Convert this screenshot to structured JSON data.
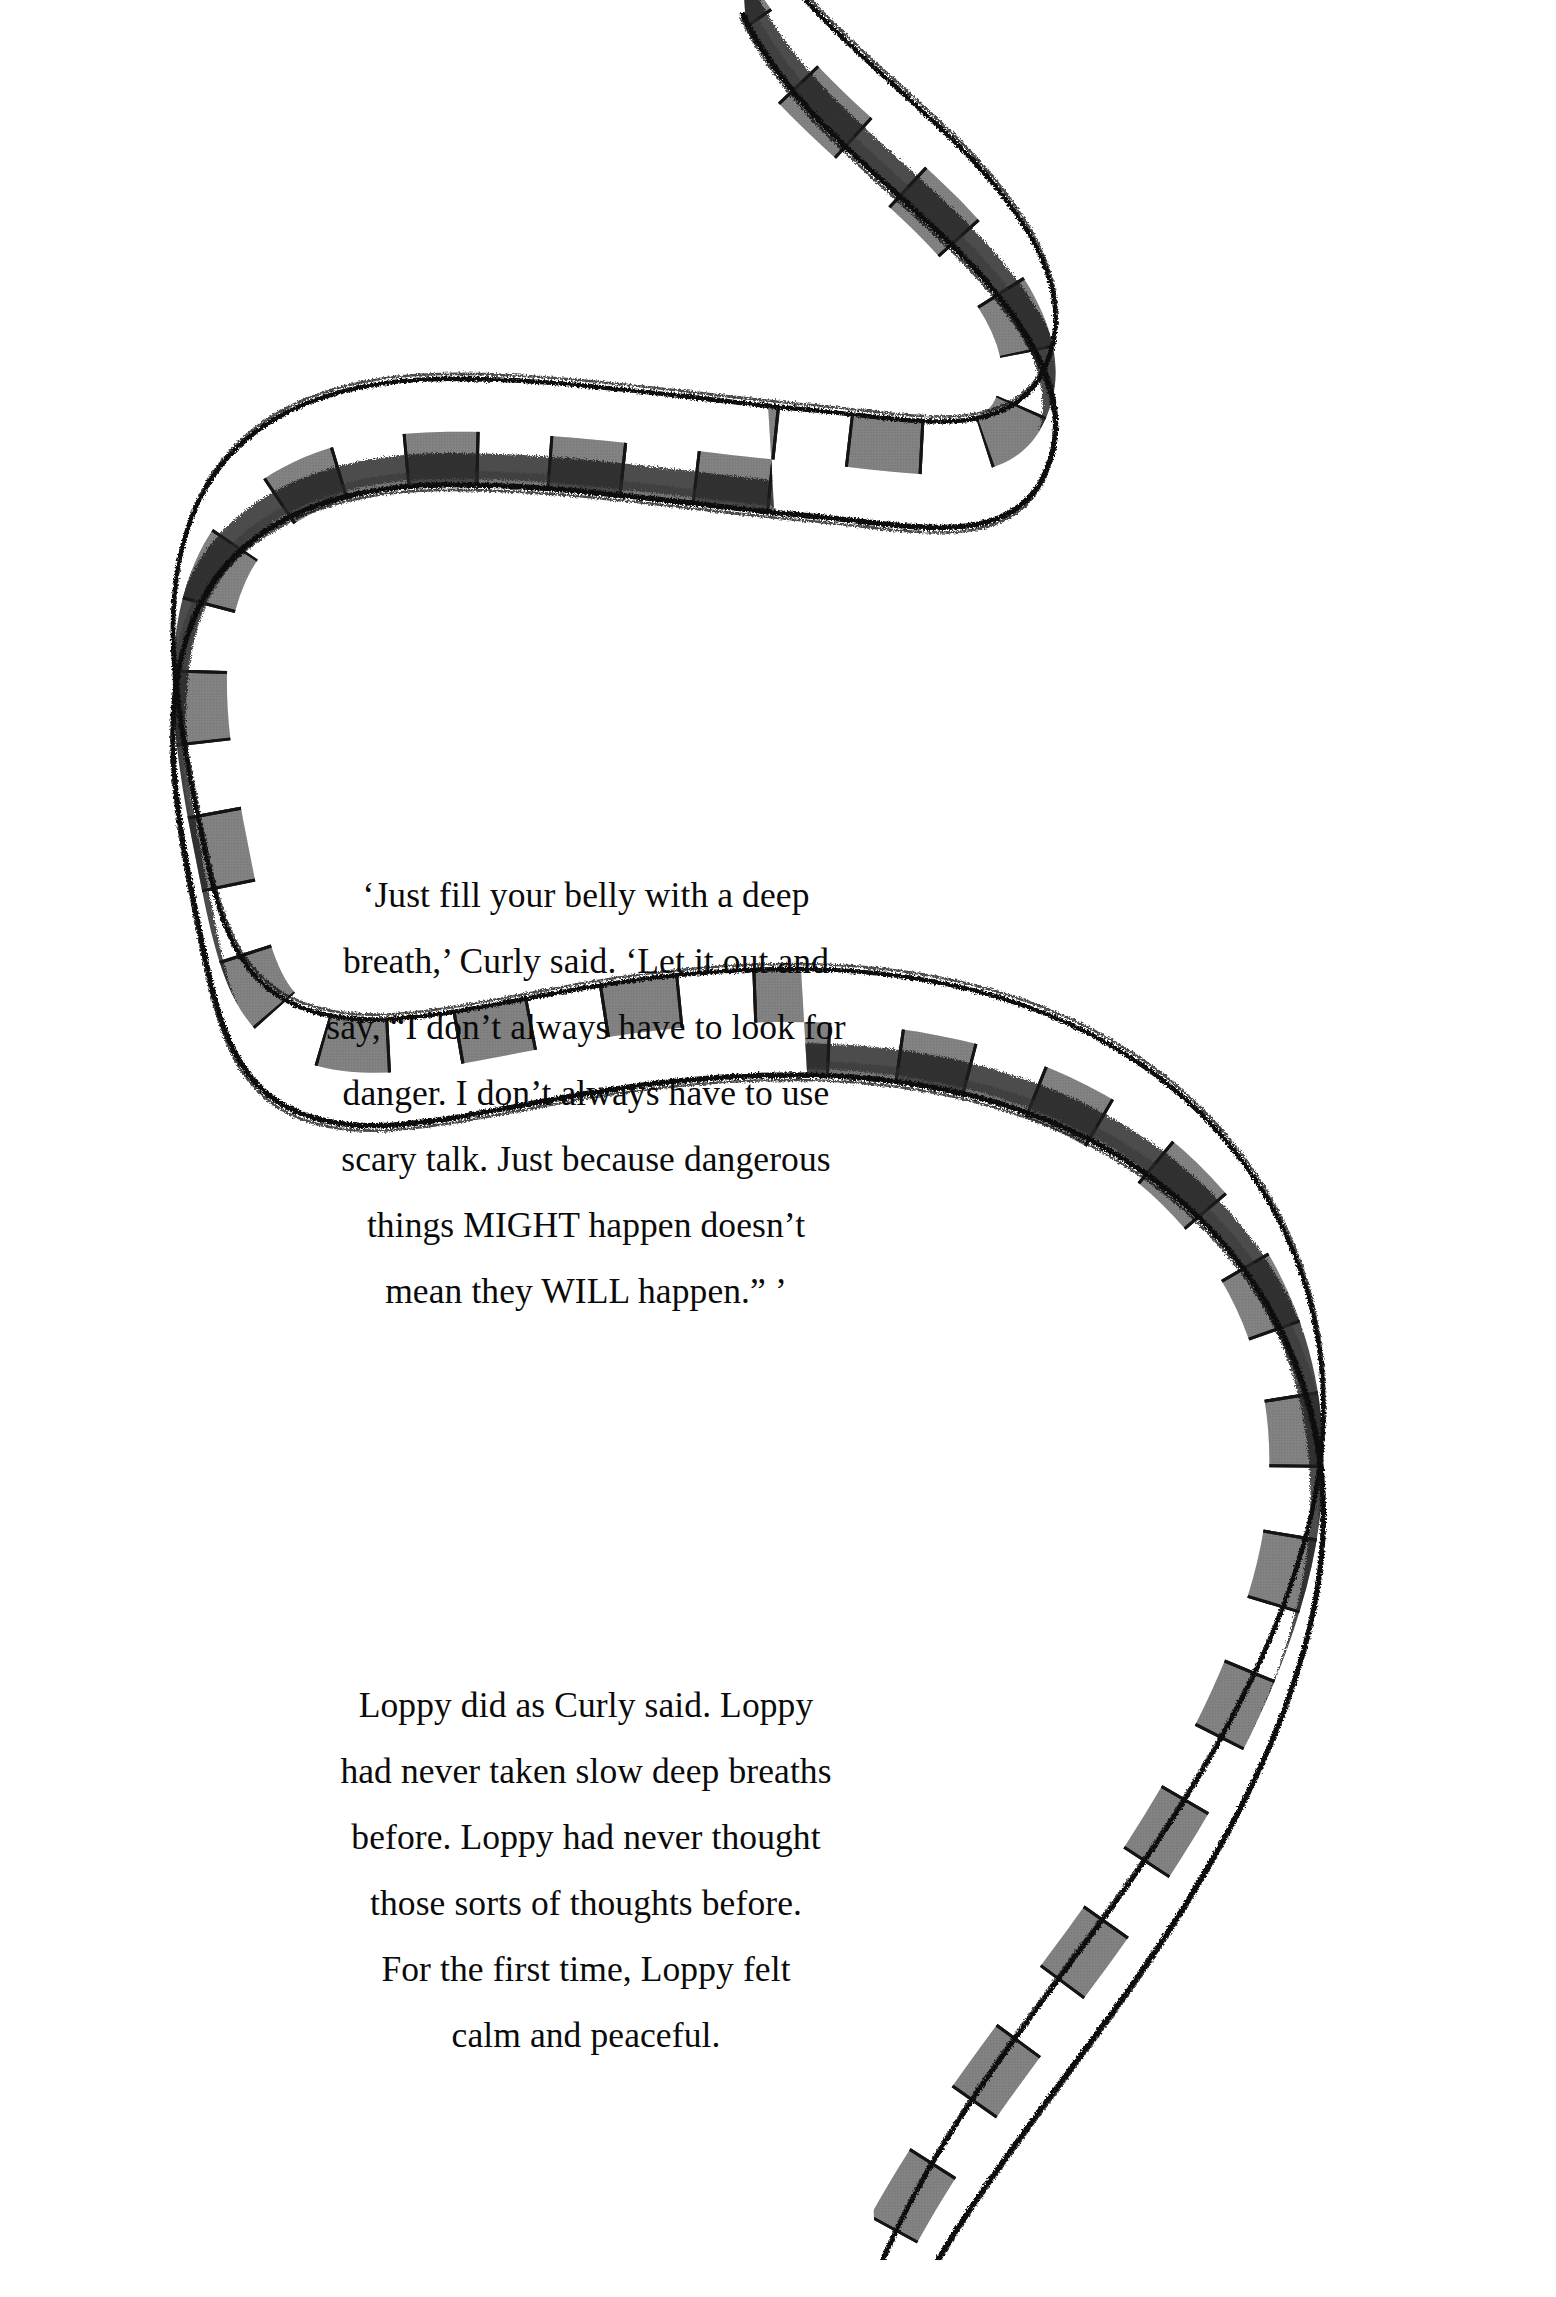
{
  "page": {
    "background_color": "#ffffff",
    "width": 1556,
    "height": 2297,
    "kind": "picture-book-page"
  },
  "illustration": {
    "name": "banded-snake",
    "description": "Hand-drawn ink snake winding in an S-curve across the page",
    "ink_color": "#111111",
    "band_color": "#878787",
    "band_color_shadow": "#6f6f6f",
    "highlight_color": "#ffffff"
  },
  "paragraph_one": {
    "lines": [
      "‘Just fill your belly with a deep",
      "breath,’ Curly said. ‘Let it out and",
      "say, “I don’t always have to look for",
      "danger. I don’t always have to use",
      "scary talk. Just because dangerous",
      "things MIGHT happen doesn’t",
      "mean they WILL happen.” ’"
    ],
    "full_text": "‘Just fill your belly with a deep breath,’ Curly said. ‘Let it out and say, “I don’t always have to look for danger. I don’t always have to use scary talk. Just because dangerous things MIGHT happen doesn’t mean they WILL happen.” ’"
  },
  "paragraph_two": {
    "lines": [
      "Loppy did as Curly said. Loppy",
      "had never taken slow deep breaths",
      "before. Loppy had never thought",
      "those sorts of thoughts before.",
      "For the first time, Loppy felt",
      "calm and peaceful."
    ],
    "full_text": "Loppy did as Curly said. Loppy had never taken slow deep breaths before. Loppy had never thought those sorts of thoughts before. For the first time, Loppy felt calm and peaceful."
  }
}
